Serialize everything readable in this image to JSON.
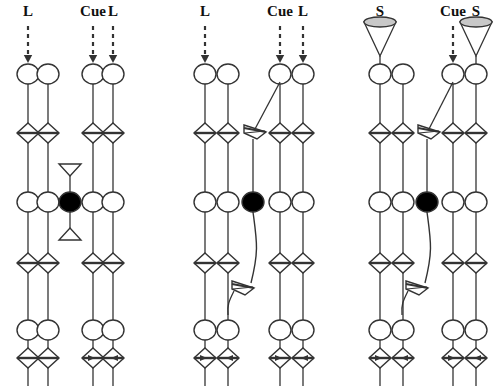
{
  "figure": {
    "type": "neural-circuit-diagram",
    "title": "",
    "width": 504,
    "height": 390,
    "background_color": "#ffffff",
    "line_color": "#333333",
    "filled_node_color": "#000000",
    "cone_fill_color": "#c8c8c8"
  },
  "labels": {
    "long_stimulus": "L",
    "short_stimulus": "S",
    "cue": "Cue"
  },
  "panels": [
    {
      "id": "panel-1",
      "name": "long-no-cue-vs-long-cue",
      "groups": [
        {
          "id": "p1-g1",
          "name": "long-uncued-group",
          "x_center": 38,
          "columns": [
            28,
            48
          ],
          "top_labels": [
            {
              "text": "L",
              "x": 28,
              "input_style": "dashed-arrow"
            },
            {
              "text": "",
              "x": 48,
              "input_style": "none"
            }
          ],
          "has_cue": false,
          "has_oblique_connector": false,
          "bottom_diamond_arrows": false
        },
        {
          "id": "p1-g2",
          "name": "long-cued-group",
          "x_center": 103,
          "columns": [
            93,
            113
          ],
          "top_labels": [
            {
              "text": "Cue",
              "x": 93,
              "input_style": "dashed-arrow"
            },
            {
              "text": "L",
              "x": 113,
              "input_style": "dashed-arrow"
            }
          ],
          "has_cue": true,
          "has_oblique_connector": false,
          "bottom_diamond_arrows": true
        }
      ],
      "interneuron": {
        "name": "inhibitory-interneuron",
        "x": 70,
        "y": 202,
        "filled": true,
        "top_triangle": true,
        "bottom_triangle": true
      }
    },
    {
      "id": "panel-2",
      "name": "long-cue-with-feedback",
      "groups": [
        {
          "id": "p2-g1",
          "name": "long-uncued-group",
          "x_center": 215,
          "columns": [
            205,
            228
          ],
          "top_labels": [
            {
              "text": "L",
              "x": 205,
              "input_style": "dashed-arrow"
            },
            {
              "text": "",
              "x": 228,
              "input_style": "none"
            }
          ],
          "has_cue": false,
          "has_oblique_connector": false,
          "bottom_diamond_arrows": true
        },
        {
          "id": "p2-g2",
          "name": "long-cued-group",
          "x_center": 290,
          "columns": [
            280,
            303
          ],
          "top_labels": [
            {
              "text": "Cue",
              "x": 280,
              "input_style": "dashed-arrow"
            },
            {
              "text": "L",
              "x": 303,
              "input_style": "dashed-arrow"
            }
          ],
          "has_cue": true,
          "has_oblique_connector": true,
          "bottom_diamond_arrows": true
        }
      ],
      "interneuron": {
        "name": "inhibitory-interneuron",
        "x": 253,
        "y": 202,
        "filled": true,
        "top_triangle": false,
        "bottom_triangle": false,
        "curved_output": true
      },
      "extra_synapse_upper": {
        "x": 255,
        "y": 133
      },
      "extra_synapse_lower": {
        "x": 243,
        "y": 285
      }
    },
    {
      "id": "panel-3",
      "name": "short-cue-with-feedback",
      "groups": [
        {
          "id": "p3-g1",
          "name": "short-uncued-group",
          "x_center": 390,
          "columns": [
            380,
            403
          ],
          "top_labels": [
            {
              "text": "S",
              "x": 380,
              "input_style": "cone"
            },
            {
              "text": "",
              "x": 403,
              "input_style": "none"
            }
          ],
          "has_cue": false,
          "has_oblique_connector": false,
          "bottom_diamond_arrows": true
        },
        {
          "id": "p3-g2",
          "name": "short-cued-group",
          "x_center": 463,
          "columns": [
            453,
            476
          ],
          "top_labels": [
            {
              "text": "Cue",
              "x": 453,
              "input_style": "dashed-arrow"
            },
            {
              "text": "S",
              "x": 476,
              "input_style": "cone"
            }
          ],
          "has_cue": true,
          "has_oblique_connector": true,
          "bottom_diamond_arrows": true
        }
      ],
      "interneuron": {
        "name": "inhibitory-interneuron",
        "x": 427,
        "y": 202,
        "filled": true,
        "top_triangle": false,
        "bottom_triangle": false,
        "curved_output": true
      },
      "extra_synapse_upper": {
        "x": 429,
        "y": 133
      },
      "extra_synapse_lower": {
        "x": 417,
        "y": 285
      }
    }
  ],
  "rows": {
    "label_y": 16,
    "dash_top_y": 26,
    "dash_bottom_y": 62,
    "cone_top_y": 22,
    "soma_row1_y": 74,
    "synapse_row1_y": 133,
    "soma_row2_y": 202,
    "synapse_row2_y": 263,
    "soma_row3_y": 330,
    "synapse_row3_y": 358,
    "axon_end_y": 386
  },
  "geometry": {
    "soma_rx": 11,
    "soma_ry": 10,
    "diamond_w": 22,
    "diamond_h": 20,
    "cone_rx": 16,
    "cone_ry": 5,
    "cone_h": 34
  }
}
